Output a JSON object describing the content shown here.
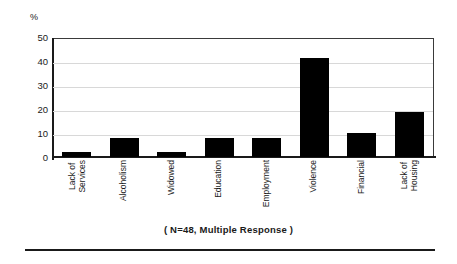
{
  "chart_data": {
    "type": "bar",
    "title": "",
    "xlabel": "",
    "ylabel": "%",
    "ylim": [
      0,
      50
    ],
    "yticks": [
      50,
      40,
      30,
      20,
      10,
      0
    ],
    "grid": true,
    "legend": "none",
    "bar_color": "#000000",
    "categories": [
      "Lack of Services",
      "Alcoholism",
      "Widowed",
      "Education",
      "Employment",
      "Violence",
      "Financial",
      "Lack of Housing"
    ],
    "category_lines": [
      [
        "Lack of",
        "Services"
      ],
      [
        "Alcoholism"
      ],
      [
        "Widowed"
      ],
      [
        "Education"
      ],
      [
        "Employment"
      ],
      [
        "Violence"
      ],
      [
        "Financial"
      ],
      [
        "Lack of",
        "Housing"
      ]
    ],
    "values": [
      2,
      8,
      2,
      8,
      8,
      42,
      10,
      19
    ],
    "caption": "( N=48, Multiple Response )",
    "sample_size": 48,
    "response_type": "Multiple Response"
  }
}
